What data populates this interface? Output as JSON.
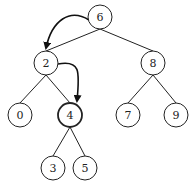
{
  "tree": {
    "nodes": [
      {
        "id": "6",
        "label": "6",
        "x": 100,
        "y": 17
      },
      {
        "id": "2",
        "label": "2",
        "x": 46,
        "y": 63
      },
      {
        "id": "8",
        "label": "8",
        "x": 153,
        "y": 63
      },
      {
        "id": "0",
        "label": "0",
        "x": 20,
        "y": 115
      },
      {
        "id": "4",
        "label": "4",
        "x": 70,
        "y": 115,
        "highlight": true
      },
      {
        "id": "7",
        "label": "7",
        "x": 128,
        "y": 115
      },
      {
        "id": "9",
        "label": "9",
        "x": 176,
        "y": 115
      },
      {
        "id": "3",
        "label": "3",
        "x": 53,
        "y": 168
      },
      {
        "id": "5",
        "label": "5",
        "x": 85,
        "y": 168
      }
    ],
    "edges": [
      [
        "6",
        "2"
      ],
      [
        "6",
        "8"
      ],
      [
        "2",
        "0"
      ],
      [
        "2",
        "4"
      ],
      [
        "8",
        "7"
      ],
      [
        "8",
        "9"
      ],
      [
        "4",
        "3"
      ],
      [
        "4",
        "5"
      ]
    ],
    "traversal_arrows": [
      [
        "6",
        "2"
      ],
      [
        "2",
        "4"
      ]
    ]
  }
}
